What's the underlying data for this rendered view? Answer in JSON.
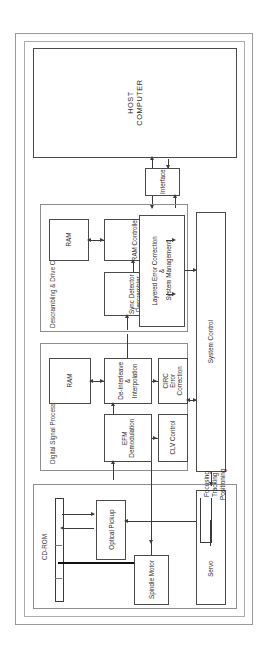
{
  "scan_header": "",
  "diagram": {
    "host": {
      "line1": "HOST",
      "line2": "COMPUTER"
    },
    "interface": {
      "label": "Interface"
    },
    "groups": {
      "descrambling": {
        "label": "Descrambling & Drive Control"
      },
      "dsp": {
        "label": "Digital Signal Processing"
      },
      "cdrom": {
        "label": "CD-ROM"
      }
    },
    "blocks": {
      "ram_top": {
        "label": "RAM"
      },
      "ram_controller": {
        "label": "RAM Controller"
      },
      "sync_detector": {
        "line1": "Sync Detector",
        "line2": "Descrambler"
      },
      "layered_ec": {
        "line1": "Layered Error Correction",
        "line2": "&",
        "line3": "System Management"
      },
      "ram_dsp": {
        "label": "RAM"
      },
      "deinterleave": {
        "line1": "De-Interleave",
        "line2": "&",
        "line3": "Interpolation"
      },
      "circ": {
        "line1": "CIRC",
        "line2": "Error",
        "line3": "Correction"
      },
      "efm": {
        "line1": "EFM",
        "line2": "Demodulation"
      },
      "clv": {
        "label": "CLV Control"
      },
      "system_control": {
        "label": "System Control"
      },
      "optical_pickup": {
        "label": "Optical Pickup"
      },
      "spindle_motor": {
        "label": "Spindle Motor"
      },
      "servo": {
        "label": "Servo"
      },
      "servo_functions": {
        "f1": "Focusing",
        "f2": "Tracking",
        "f3": "Positioning"
      }
    },
    "colors": {
      "line": "#3b3b3b",
      "box_border": "#4a4a4a",
      "group_border": "#8d8d92",
      "frame": "#9a9a9e",
      "text": "#262626",
      "background": "#ffffff"
    }
  }
}
